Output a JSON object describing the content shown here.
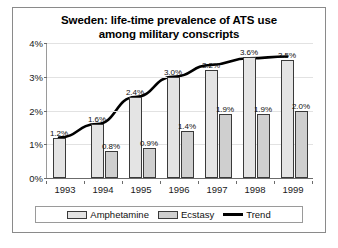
{
  "chart_data": {
    "type": "bar",
    "title": "Sweden: life-time prevalence of ATS use among military conscripts",
    "title_line1": "Sweden: life-time prevalence of ATS use",
    "title_line2": "among military conscripts",
    "xlabel": "",
    "ylabel": "",
    "categories": [
      "1993",
      "1994",
      "1995",
      "1996",
      "1997",
      "1998",
      "1999"
    ],
    "ylim": [
      0,
      4
    ],
    "ytick_labels": [
      "0%",
      "1%",
      "2%",
      "3%",
      "4%"
    ],
    "ytick_values": [
      0,
      1,
      2,
      3,
      4
    ],
    "grid": true,
    "legend_position": "bottom",
    "series": [
      {
        "name": "Amphetamine",
        "type": "bar",
        "color": "#e4e4e4",
        "values": [
          1.2,
          1.6,
          2.4,
          3.0,
          3.2,
          3.6,
          3.5
        ],
        "labels": [
          "1.2%",
          "1.6%",
          "2.4%",
          "3.0%",
          "3.2%",
          "3.6%",
          "3.5%"
        ]
      },
      {
        "name": "Ecstasy",
        "type": "bar",
        "color": "#cfcfcf",
        "values": [
          null,
          0.8,
          0.9,
          1.4,
          1.9,
          1.9,
          2.0
        ],
        "labels": [
          "",
          "0.8%",
          "0.9%",
          "1.4%",
          "1.9%",
          "1.9%",
          "2.0%"
        ]
      },
      {
        "name": "Trend",
        "type": "line",
        "color": "#000000",
        "values": [
          1.2,
          1.6,
          2.4,
          3.0,
          3.35,
          3.55,
          3.6
        ]
      }
    ]
  },
  "legend": {
    "items": [
      {
        "label": "Amphetamine",
        "marker": "bar-swatch-light"
      },
      {
        "label": "Ecstasy",
        "marker": "bar-swatch-gray"
      },
      {
        "label": "Trend",
        "marker": "line-swatch-black"
      }
    ]
  }
}
